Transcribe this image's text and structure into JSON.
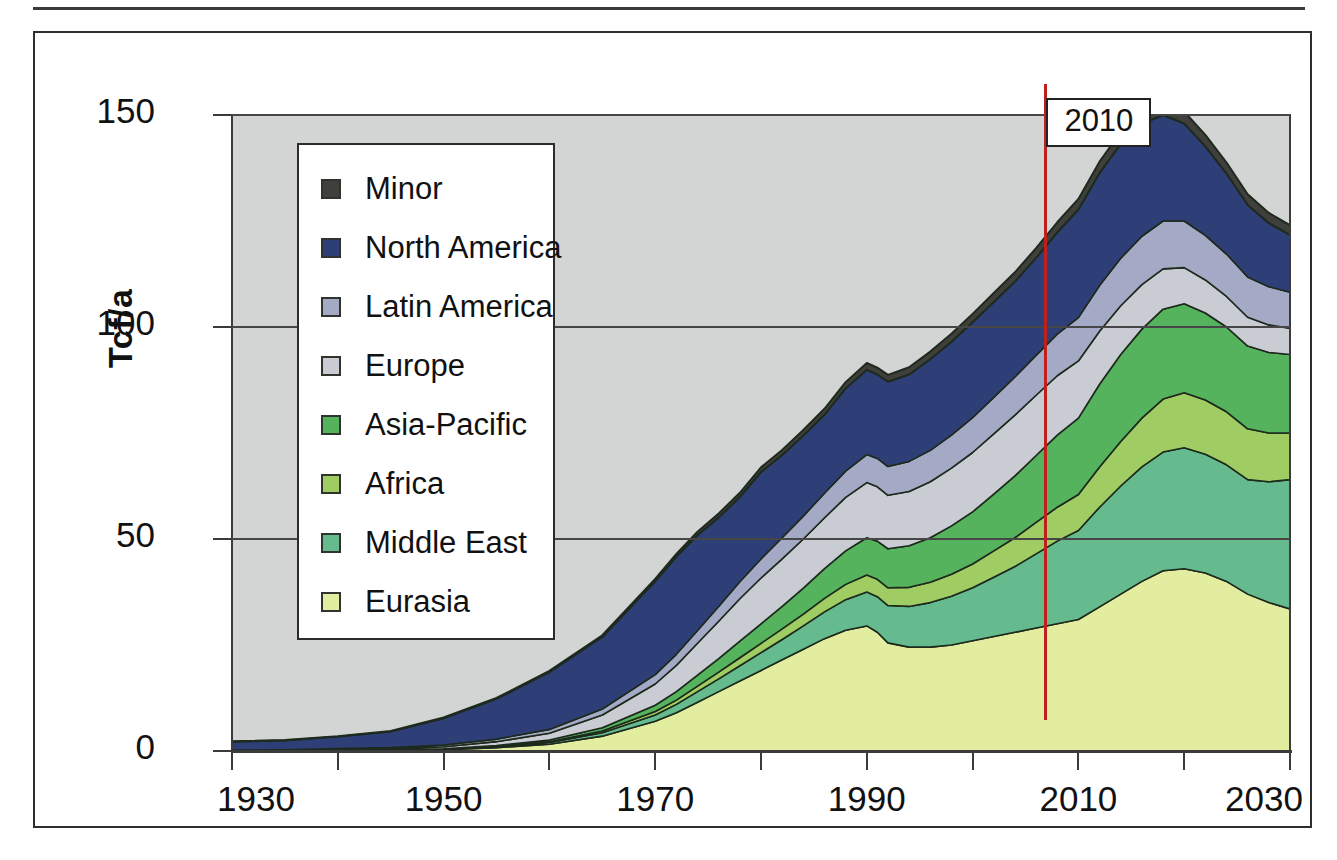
{
  "axes": {
    "ylabel": "Tcf/a",
    "yticks": [
      0,
      50,
      100,
      150
    ],
    "ytick_labels": [
      "0",
      "50",
      "100",
      "150"
    ],
    "xticks": [
      1930,
      1940,
      1950,
      1960,
      1970,
      1980,
      1990,
      2000,
      2010,
      2020,
      2030
    ],
    "xtick_labels_shown": [
      "1930",
      "1950",
      "1970",
      "1990",
      "2010",
      "2030"
    ],
    "ylim": [
      0,
      150
    ],
    "xlim": [
      1930,
      2030
    ],
    "grid": "horizontal"
  },
  "annotation": {
    "label": "2010",
    "year": 2010,
    "line_color": "#c0201c"
  },
  "legend": {
    "position": "upper-left-inside",
    "items": [
      {
        "label": "Minor",
        "color": "#3f3f3c"
      },
      {
        "label": "North America",
        "color": "#2e3f77"
      },
      {
        "label": "Latin America",
        "color": "#a4a9c6"
      },
      {
        "label": "Europe",
        "color": "#c9ccd2"
      },
      {
        "label": "Asia-Pacific",
        "color": "#54b35c"
      },
      {
        "label": "Africa",
        "color": "#9fcc63"
      },
      {
        "label": "Middle East",
        "color": "#66bb8e"
      },
      {
        "label": "Eurasia",
        "color": "#e2eda0"
      }
    ]
  },
  "style": {
    "plot_background": "#d3d5d4",
    "frame_color": "#2e2e2e",
    "area_outline": "#1d2a1d"
  },
  "chart_data": {
    "type": "area",
    "stacked": true,
    "title": "",
    "xlabel": "",
    "ylabel": "Tcf/a",
    "xlim": [
      1930,
      2030
    ],
    "ylim": [
      0,
      150
    ],
    "grid": true,
    "legend_position": "upper-left-inside",
    "annotations": [
      {
        "type": "vline",
        "x": 2010,
        "label": "2010",
        "color": "#c0201c"
      }
    ],
    "x": [
      1930,
      1935,
      1940,
      1945,
      1950,
      1955,
      1960,
      1965,
      1970,
      1972,
      1974,
      1976,
      1978,
      1980,
      1982,
      1984,
      1986,
      1988,
      1990,
      1991,
      1992,
      1994,
      1996,
      1998,
      2000,
      2002,
      2004,
      2006,
      2008,
      2010,
      2012,
      2014,
      2016,
      2018,
      2020,
      2022,
      2024,
      2026,
      2028,
      2030
    ],
    "series": [
      {
        "name": "Eurasia",
        "values": [
          0.0,
          0.0,
          0.1,
          0.2,
          0.3,
          0.8,
          1.6,
          3.5,
          7.0,
          9.0,
          11.5,
          14.0,
          16.5,
          19.0,
          21.5,
          24.0,
          26.5,
          28.5,
          29.5,
          28.0,
          25.5,
          24.5,
          24.5,
          25.0,
          26.0,
          27.0,
          28.0,
          29.0,
          30.0,
          31.0,
          34.0,
          37.0,
          40.0,
          42.5,
          43.0,
          42.0,
          40.0,
          37.0,
          35.0,
          33.5
        ]
      },
      {
        "name": "Middle East",
        "values": [
          0.0,
          0.0,
          0.0,
          0.0,
          0.1,
          0.2,
          0.4,
          0.8,
          1.5,
          2.0,
          2.5,
          3.0,
          3.6,
          4.2,
          4.8,
          5.5,
          6.3,
          7.2,
          8.0,
          8.4,
          8.8,
          9.6,
          10.5,
          11.5,
          12.5,
          14.0,
          15.5,
          17.5,
          19.5,
          21.0,
          23.5,
          25.5,
          27.0,
          28.0,
          28.5,
          28.0,
          27.5,
          27.0,
          28.5,
          30.5
        ]
      },
      {
        "name": "Africa",
        "values": [
          0.0,
          0.0,
          0.0,
          0.0,
          0.0,
          0.1,
          0.2,
          0.4,
          0.8,
          1.0,
          1.3,
          1.6,
          1.9,
          2.2,
          2.5,
          2.8,
          3.2,
          3.6,
          4.0,
          4.1,
          4.2,
          4.5,
          4.8,
          5.2,
          5.6,
          6.2,
          6.8,
          7.4,
          8.0,
          8.5,
          9.5,
          10.5,
          11.5,
          12.5,
          13.0,
          12.8,
          12.5,
          12.0,
          11.5,
          11.0
        ]
      },
      {
        "name": "Asia-Pacific",
        "values": [
          0.0,
          0.0,
          0.0,
          0.0,
          0.1,
          0.2,
          0.4,
          0.8,
          1.5,
          2.0,
          2.6,
          3.2,
          3.9,
          4.6,
          5.3,
          6.1,
          7.0,
          7.9,
          8.8,
          9.0,
          9.2,
          9.8,
          10.5,
          11.4,
          12.3,
          13.4,
          14.6,
          15.8,
          17.0,
          18.0,
          19.5,
          20.5,
          21.0,
          21.2,
          21.0,
          20.5,
          20.0,
          19.5,
          19.0,
          18.5
        ]
      },
      {
        "name": "Europe",
        "values": [
          0.1,
          0.2,
          0.3,
          0.3,
          0.5,
          0.9,
          1.6,
          3.0,
          5.0,
          6.2,
          7.5,
          8.8,
          10.0,
          10.8,
          11.2,
          11.6,
          12.0,
          12.6,
          13.0,
          12.8,
          12.6,
          12.8,
          13.2,
          13.6,
          14.0,
          14.2,
          14.3,
          14.2,
          14.0,
          13.5,
          12.5,
          11.5,
          10.5,
          9.5,
          8.5,
          7.8,
          7.2,
          6.8,
          6.5,
          6.2
        ]
      },
      {
        "name": "Latin America",
        "values": [
          0.1,
          0.1,
          0.2,
          0.3,
          0.4,
          0.6,
          0.9,
          1.4,
          2.2,
          2.6,
          3.0,
          3.5,
          4.0,
          4.5,
          5.0,
          5.4,
          5.8,
          6.2,
          6.6,
          6.7,
          6.8,
          7.1,
          7.4,
          7.8,
          8.2,
          8.6,
          9.0,
          9.4,
          9.8,
          10.2,
          10.8,
          11.2,
          11.4,
          11.3,
          11.0,
          10.5,
          10.0,
          9.5,
          9.0,
          8.5
        ]
      },
      {
        "name": "North America",
        "values": [
          2.0,
          2.2,
          2.8,
          3.8,
          6.3,
          9.5,
          13.5,
          17.0,
          22.0,
          23.0,
          22.5,
          21.0,
          20.0,
          20.5,
          19.5,
          19.0,
          18.5,
          19.5,
          20.0,
          19.8,
          20.0,
          20.5,
          21.5,
          22.0,
          22.5,
          22.5,
          22.5,
          23.0,
          24.0,
          25.5,
          26.5,
          27.0,
          26.5,
          25.0,
          23.0,
          21.0,
          19.0,
          17.0,
          15.0,
          13.5
        ]
      },
      {
        "name": "Minor",
        "values": [
          0.1,
          0.1,
          0.1,
          0.1,
          0.2,
          0.2,
          0.3,
          0.4,
          0.6,
          0.7,
          0.8,
          0.9,
          1.0,
          1.1,
          1.2,
          1.3,
          1.4,
          1.5,
          1.6,
          1.6,
          1.6,
          1.7,
          1.8,
          1.9,
          2.0,
          2.1,
          2.2,
          2.3,
          2.4,
          2.5,
          2.7,
          2.8,
          2.9,
          2.9,
          2.8,
          2.7,
          2.6,
          2.5,
          2.4,
          2.3
        ]
      }
    ]
  }
}
